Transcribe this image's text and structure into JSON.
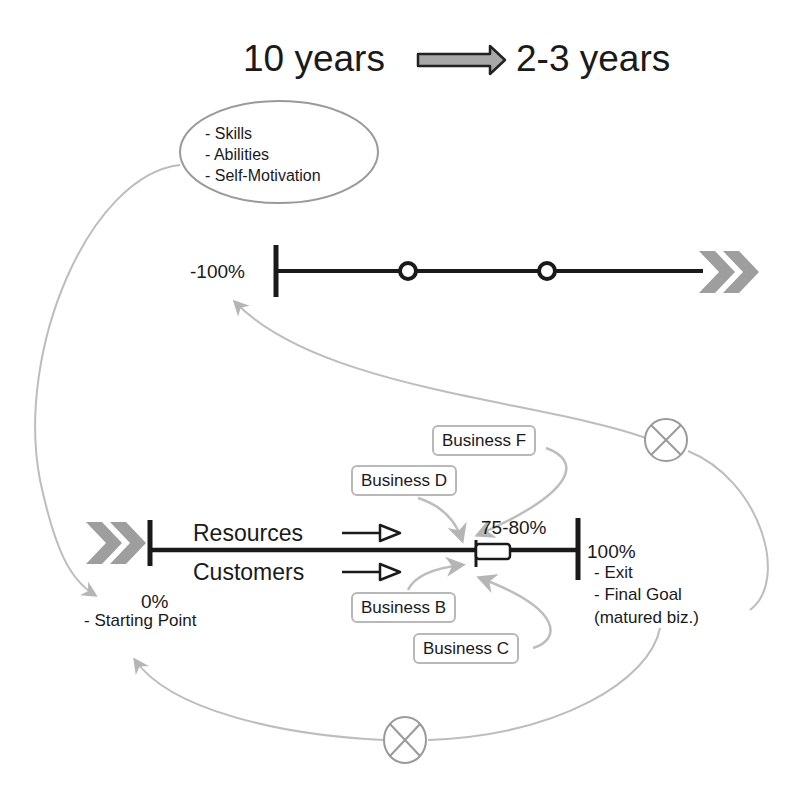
{
  "header": {
    "from_label": "10 years",
    "to_label": "2-3 years",
    "arrow_icon": "block-right-arrow"
  },
  "personal_factors": {
    "items": [
      "- Skills",
      "- Abilities",
      "- Self-Motivation"
    ]
  },
  "top_timeline": {
    "start_label": "-100%",
    "milestones": 2,
    "end_icon": "double-chevron-right"
  },
  "main_timeline": {
    "start_icon": "double-chevron-right",
    "start_label": "0%",
    "start_note": "- Starting Point",
    "inputs": [
      "Resources",
      "Customers"
    ],
    "target_label": "75-80%",
    "end_label": "100%",
    "end_notes": [
      "- Exit",
      "- Final Goal",
      "(matured biz.)"
    ]
  },
  "businesses": [
    "Business F",
    "Business D",
    "Business B",
    "Business C"
  ],
  "loop_icons": [
    "multiply-circle-icon",
    "multiply-circle-icon"
  ],
  "colors": {
    "line": "#1a1a1a",
    "connector": "#bdbdbd",
    "chevron": "#9e9e9e",
    "arrow_fill": "#a8a8a8"
  }
}
